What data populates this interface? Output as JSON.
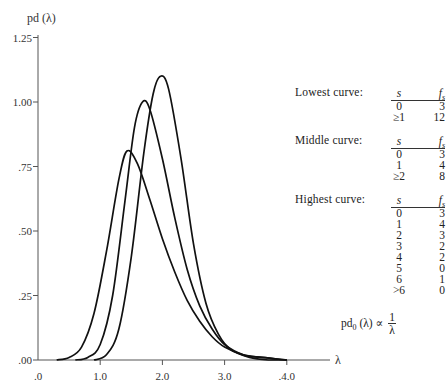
{
  "chart_data": {
    "type": "line",
    "title": "",
    "xlabel": "λ",
    "ylabel": "pd (λ)",
    "xlim": [
      0,
      4.4
    ],
    "ylim": [
      0,
      1.25
    ],
    "grid": false,
    "x_ticks": [
      {
        "value": 0.0,
        "label": ".0"
      },
      {
        "value": 1.0,
        "label": "1.0"
      },
      {
        "value": 2.0,
        "label": "2.0"
      },
      {
        "value": 3.0,
        "label": "3.0"
      },
      {
        "value": 4.0,
        "label": ".4.0"
      }
    ],
    "y_ticks": [
      {
        "value": 0.0,
        "label": ".00"
      },
      {
        "value": 0.25,
        "label": ".25"
      },
      {
        "value": 0.5,
        "label": ".50"
      },
      {
        "value": 0.75,
        "label": ".75"
      },
      {
        "value": 1.0,
        "label": "1.00"
      },
      {
        "value": 1.25,
        "label": "1.25"
      }
    ],
    "series": [
      {
        "name": "Lowest curve",
        "peak": {
          "x": 1.43,
          "y": 0.81
        },
        "x": [
          0.3,
          0.5,
          0.7,
          0.9,
          1.1,
          1.3,
          1.43,
          1.6,
          1.8,
          2.0,
          2.2,
          2.4,
          2.6,
          2.8,
          3.0,
          3.3,
          3.6,
          4.0
        ],
        "values": [
          0.0,
          0.01,
          0.05,
          0.18,
          0.42,
          0.7,
          0.81,
          0.76,
          0.62,
          0.47,
          0.34,
          0.23,
          0.15,
          0.09,
          0.05,
          0.02,
          0.01,
          0.0
        ]
      },
      {
        "name": "Middle curve",
        "peak": {
          "x": 1.68,
          "y": 1.0
        },
        "x": [
          0.6,
          0.8,
          1.0,
          1.2,
          1.4,
          1.55,
          1.68,
          1.8,
          2.0,
          2.2,
          2.4,
          2.6,
          2.8,
          3.0,
          3.3,
          3.6,
          4.0
        ],
        "values": [
          0.0,
          0.01,
          0.06,
          0.25,
          0.62,
          0.9,
          1.0,
          0.97,
          0.78,
          0.55,
          0.35,
          0.21,
          0.12,
          0.06,
          0.02,
          0.01,
          0.0
        ]
      },
      {
        "name": "Highest curve",
        "peak": {
          "x": 1.97,
          "y": 1.1
        },
        "x": [
          0.9,
          1.1,
          1.3,
          1.5,
          1.7,
          1.85,
          1.97,
          2.1,
          2.3,
          2.5,
          2.7,
          2.9,
          3.1,
          3.4,
          3.7,
          4.0
        ],
        "values": [
          0.0,
          0.02,
          0.12,
          0.4,
          0.8,
          1.03,
          1.1,
          1.05,
          0.78,
          0.45,
          0.22,
          0.1,
          0.04,
          0.01,
          0.0,
          0.0
        ]
      }
    ],
    "legend_position": "right",
    "annotations": [
      "pd₀ (λ) ∝ 1/λ"
    ]
  },
  "axes": {
    "ylabel": "pd (λ)",
    "xlabel": "λ"
  },
  "legend": {
    "lowest": {
      "name": "Lowest curve:",
      "col_s": "s",
      "col_f": "fs",
      "rows": [
        {
          "s": "0",
          "f": "3"
        },
        {
          "s": "≥1",
          "f": "12"
        }
      ]
    },
    "middle": {
      "name": "Middle curve:",
      "col_s": "s",
      "col_f": "fs",
      "rows": [
        {
          "s": "0",
          "f": "3"
        },
        {
          "s": "1",
          "f": "4"
        },
        {
          "s": "≥2",
          "f": "8"
        }
      ]
    },
    "highest": {
      "name": "Highest curve:",
      "col_s": "s",
      "col_f": "fs",
      "rows": [
        {
          "s": "0",
          "f": "3"
        },
        {
          "s": "1",
          "f": "4"
        },
        {
          "s": "2",
          "f": "3"
        },
        {
          "s": "3",
          "f": "2"
        },
        {
          "s": "4",
          "f": "2"
        },
        {
          "s": "5",
          "f": "0"
        },
        {
          "s": "6",
          "f": "1"
        },
        {
          "s": ">6",
          "f": "0"
        }
      ]
    }
  },
  "formula": {
    "lhs": "pd",
    "sub": "0",
    "arg": " (λ) ∝ ",
    "num": "1",
    "den": "λ"
  }
}
